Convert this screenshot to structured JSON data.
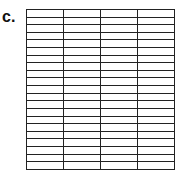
{
  "figure": {
    "label": "c.",
    "grid": {
      "rows": 21,
      "columns": 4,
      "line_color": "#222222",
      "fill_color": "#ffffff"
    }
  }
}
